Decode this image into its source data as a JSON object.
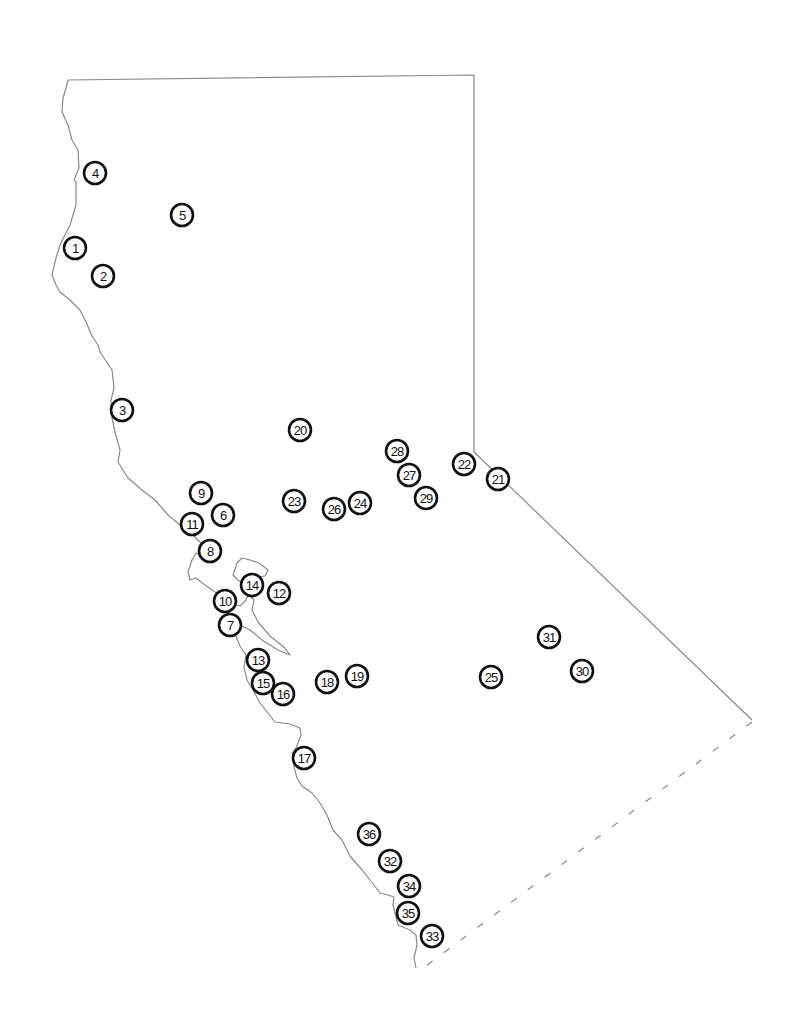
{
  "map": {
    "title": "",
    "border_color": "#8a8a8a",
    "marker_stroke": "#111111",
    "markers": [
      {
        "id": "1",
        "x": 75,
        "y": 248
      },
      {
        "id": "2",
        "x": 103,
        "y": 276
      },
      {
        "id": "3",
        "x": 122,
        "y": 410
      },
      {
        "id": "4",
        "x": 95,
        "y": 173
      },
      {
        "id": "5",
        "x": 182,
        "y": 215
      },
      {
        "id": "6",
        "x": 223,
        "y": 515
      },
      {
        "id": "7",
        "x": 230,
        "y": 625
      },
      {
        "id": "8",
        "x": 210,
        "y": 551
      },
      {
        "id": "9",
        "x": 201,
        "y": 493
      },
      {
        "id": "10",
        "x": 225,
        "y": 601
      },
      {
        "id": "11",
        "x": 192,
        "y": 524
      },
      {
        "id": "12",
        "x": 279,
        "y": 593
      },
      {
        "id": "13",
        "x": 258,
        "y": 660
      },
      {
        "id": "14",
        "x": 252,
        "y": 585
      },
      {
        "id": "15",
        "x": 263,
        "y": 683
      },
      {
        "id": "16",
        "x": 283,
        "y": 694
      },
      {
        "id": "17",
        "x": 304,
        "y": 758
      },
      {
        "id": "18",
        "x": 327,
        "y": 682
      },
      {
        "id": "19",
        "x": 357,
        "y": 676
      },
      {
        "id": "20",
        "x": 300,
        "y": 430
      },
      {
        "id": "21",
        "x": 498,
        "y": 479
      },
      {
        "id": "22",
        "x": 464,
        "y": 464
      },
      {
        "id": "23",
        "x": 294,
        "y": 501
      },
      {
        "id": "24",
        "x": 360,
        "y": 503
      },
      {
        "id": "25",
        "x": 491,
        "y": 677
      },
      {
        "id": "26",
        "x": 334,
        "y": 509
      },
      {
        "id": "27",
        "x": 409,
        "y": 475
      },
      {
        "id": "28",
        "x": 397,
        "y": 451
      },
      {
        "id": "29",
        "x": 426,
        "y": 498
      },
      {
        "id": "30",
        "x": 582,
        "y": 671
      },
      {
        "id": "31",
        "x": 549,
        "y": 637
      },
      {
        "id": "32",
        "x": 390,
        "y": 861
      },
      {
        "id": "33",
        "x": 432,
        "y": 936
      },
      {
        "id": "34",
        "x": 409,
        "y": 886
      },
      {
        "id": "35",
        "x": 408,
        "y": 913
      },
      {
        "id": "36",
        "x": 369,
        "y": 834
      }
    ]
  }
}
